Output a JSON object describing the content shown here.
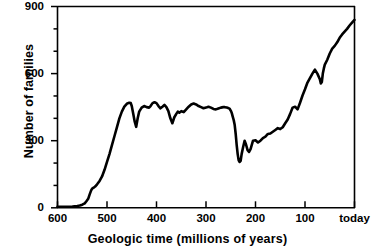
{
  "chart_data": {
    "type": "line",
    "title": "",
    "xlabel": "Geologic time (millions of years)",
    "ylabel": "Number of families",
    "xlim": [
      600,
      0
    ],
    "ylim": [
      0,
      900
    ],
    "x_axis_inverted": true,
    "grid": false,
    "legend": null,
    "x_tick_labels": [
      "600",
      "500",
      "400",
      "300",
      "200",
      "100",
      "today"
    ],
    "x_tick_values": [
      600,
      500,
      400,
      300,
      200,
      100,
      0
    ],
    "x_minor_tick_count": 0,
    "y_tick_labels": [
      "0",
      "300",
      "600",
      "900"
    ],
    "y_tick_values": [
      0,
      300,
      600,
      900
    ],
    "y_minor_tick_values": [
      100,
      200,
      400,
      500,
      700,
      800
    ],
    "series": [
      {
        "name": "Number of families",
        "color": "#000000",
        "x": [
          600,
          590,
          580,
          570,
          565,
          560,
          555,
          550,
          545,
          542,
          538,
          535,
          532,
          530,
          527,
          524,
          520,
          515,
          510,
          505,
          500,
          495,
          490,
          485,
          480,
          475,
          470,
          465,
          460,
          455,
          452,
          450,
          447,
          444,
          441,
          438,
          435,
          430,
          425,
          420,
          415,
          412,
          408,
          404,
          400,
          396,
          392,
          388,
          384,
          380,
          376,
          372,
          368,
          364,
          360,
          357,
          354,
          350,
          345,
          340,
          335,
          330,
          325,
          320,
          315,
          310,
          305,
          300,
          295,
          290,
          285,
          280,
          275,
          270,
          265,
          262,
          258,
          254,
          252,
          251,
          250,
          249,
          248,
          246,
          244,
          242,
          240,
          238,
          236,
          234,
          232,
          230,
          228,
          225,
          222,
          219,
          216,
          213,
          210,
          205,
          200,
          195,
          190,
          185,
          180,
          175,
          170,
          165,
          160,
          155,
          150,
          145,
          140,
          135,
          130,
          125,
          120,
          115,
          110,
          105,
          100,
          95,
          90,
          85,
          80,
          75,
          70,
          68,
          66,
          64,
          62,
          60,
          55,
          50,
          45,
          40,
          35,
          30,
          25,
          20,
          15,
          10,
          5,
          0
        ],
        "y": [
          5,
          5,
          5,
          6,
          7,
          8,
          10,
          14,
          20,
          28,
          40,
          60,
          78,
          86,
          90,
          95,
          105,
          120,
          140,
          170,
          205,
          240,
          280,
          320,
          360,
          400,
          430,
          452,
          465,
          470,
          468,
          455,
          420,
          385,
          362,
          400,
          430,
          448,
          455,
          450,
          448,
          455,
          468,
          472,
          468,
          455,
          445,
          452,
          460,
          450,
          432,
          400,
          378,
          405,
          420,
          430,
          425,
          432,
          428,
          440,
          452,
          462,
          466,
          462,
          455,
          450,
          445,
          448,
          452,
          448,
          442,
          440,
          444,
          448,
          450,
          450,
          448,
          445,
          442,
          438,
          434,
          430,
          424,
          408,
          392,
          370,
          330,
          280,
          240,
          212,
          205,
          210,
          240,
          272,
          300,
          282,
          258,
          250,
          262,
          300,
          302,
          292,
          300,
          312,
          318,
          330,
          332,
          340,
          348,
          356,
          352,
          360,
          378,
          395,
          420,
          448,
          452,
          440,
          470,
          502,
          530,
          560,
          580,
          600,
          618,
          600,
          575,
          556,
          562,
          600,
          622,
          640,
          662,
          690,
          712,
          724,
          740,
          760,
          775,
          788,
          800,
          815,
          828,
          840
        ]
      }
    ]
  },
  "axes": {
    "x_title": "Geologic time (millions of years)",
    "y_title": "Number of families"
  }
}
